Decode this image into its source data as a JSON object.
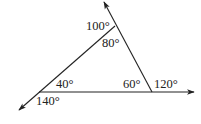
{
  "diagram": {
    "type": "triangle-exterior-angles",
    "colors": {
      "line": "#222222",
      "background": "#ffffff"
    },
    "vertices": {
      "top": {
        "interior_angle": "80°",
        "exterior_angle": "100°"
      },
      "left": {
        "interior_angle": "40°",
        "exterior_angle": "140°"
      },
      "right": {
        "interior_angle": "60°",
        "exterior_angle": "120°"
      }
    },
    "labels": {
      "top_exterior": "100°",
      "top_interior": "80°",
      "left_interior": "40°",
      "left_exterior": "140°",
      "right_interior": "60°",
      "right_exterior": "120°"
    }
  }
}
